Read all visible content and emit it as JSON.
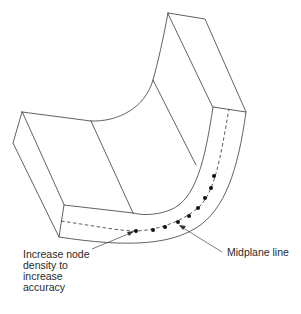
{
  "diagram": {
    "labels": {
      "node_density": "Increase node\ndensity to\nincrease\naccuracy",
      "midplane": "Midplane line"
    },
    "caption": "",
    "nodes": [
      {
        "x": 214,
        "y": 176
      },
      {
        "x": 211,
        "y": 188
      },
      {
        "x": 205,
        "y": 198
      },
      {
        "x": 198,
        "y": 208
      },
      {
        "x": 189,
        "y": 216
      },
      {
        "x": 178,
        "y": 222
      },
      {
        "x": 165,
        "y": 227
      },
      {
        "x": 153,
        "y": 230
      },
      {
        "x": 136,
        "y": 231
      }
    ],
    "colors": {
      "line": "#3a3a3a",
      "node": "#111111",
      "text": "#2a2a2a",
      "background": "#ffffff"
    }
  }
}
